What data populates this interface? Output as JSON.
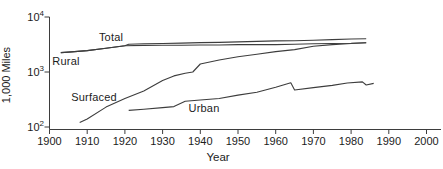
{
  "figure": {
    "background": "#ffffff",
    "line_color": "#3d3d3d",
    "text_color": "#1c1c1c"
  },
  "chart_data": {
    "type": "line",
    "title": "",
    "xlabel": "Year",
    "ylabel": "1,000 Miles",
    "grid": false,
    "legend_position": "inline-annotations",
    "x_axis": {
      "min": 1900,
      "max": 2000,
      "tick_interval": 10,
      "ticks": [
        1900,
        1910,
        1920,
        1930,
        1940,
        1950,
        1960,
        1970,
        1980,
        1990,
        2000
      ]
    },
    "y_axis": {
      "scale": "log",
      "min": 100,
      "max": 10000,
      "ticks": [
        {
          "value": 10000,
          "base": "10",
          "exp": "4"
        },
        {
          "value": 1000,
          "base": "10",
          "exp": "3"
        },
        {
          "value": 100,
          "base": "10",
          "exp": "2"
        }
      ]
    },
    "series": [
      {
        "name": "Total",
        "points": [
          [
            1903,
            2250
          ],
          [
            1905,
            2300
          ],
          [
            1910,
            2450
          ],
          [
            1915,
            2700
          ],
          [
            1920,
            3000
          ],
          [
            1921,
            3200
          ],
          [
            1925,
            3250
          ],
          [
            1930,
            3300
          ],
          [
            1935,
            3350
          ],
          [
            1940,
            3420
          ],
          [
            1945,
            3450
          ],
          [
            1950,
            3530
          ],
          [
            1955,
            3600
          ],
          [
            1960,
            3680
          ],
          [
            1965,
            3700
          ],
          [
            1970,
            3780
          ],
          [
            1975,
            3880
          ],
          [
            1980,
            3980
          ],
          [
            1984,
            4020
          ]
        ]
      },
      {
        "name": "Rural",
        "points": [
          [
            1903,
            2250
          ],
          [
            1905,
            2300
          ],
          [
            1910,
            2450
          ],
          [
            1915,
            2700
          ],
          [
            1920,
            3000
          ],
          [
            1925,
            3040
          ],
          [
            1930,
            3075
          ],
          [
            1935,
            3060
          ],
          [
            1940,
            3100
          ],
          [
            1945,
            3100
          ],
          [
            1950,
            3150
          ],
          [
            1955,
            3150
          ],
          [
            1960,
            3150
          ],
          [
            1965,
            3200
          ],
          [
            1970,
            3250
          ],
          [
            1975,
            3300
          ],
          [
            1980,
            3320
          ],
          [
            1984,
            3400
          ]
        ]
      },
      {
        "name": "Surfaced",
        "points": [
          [
            1908,
            120
          ],
          [
            1910,
            140
          ],
          [
            1915,
            230
          ],
          [
            1920,
            330
          ],
          [
            1925,
            450
          ],
          [
            1930,
            700
          ],
          [
            1933,
            850
          ],
          [
            1936,
            950
          ],
          [
            1938,
            1000
          ],
          [
            1940,
            1400
          ],
          [
            1945,
            1650
          ],
          [
            1950,
            1900
          ],
          [
            1955,
            2100
          ],
          [
            1960,
            2350
          ],
          [
            1965,
            2550
          ],
          [
            1970,
            2950
          ],
          [
            1975,
            3150
          ],
          [
            1980,
            3300
          ],
          [
            1984,
            3400
          ]
        ]
      },
      {
        "name": "Urban",
        "points": [
          [
            1921,
            200
          ],
          [
            1925,
            210
          ],
          [
            1930,
            225
          ],
          [
            1933,
            235
          ],
          [
            1936,
            295
          ],
          [
            1940,
            310
          ],
          [
            1945,
            330
          ],
          [
            1950,
            380
          ],
          [
            1955,
            430
          ],
          [
            1960,
            530
          ],
          [
            1964,
            640
          ],
          [
            1965,
            470
          ],
          [
            1970,
            520
          ],
          [
            1975,
            570
          ],
          [
            1979,
            630
          ],
          [
            1983,
            660
          ],
          [
            1984,
            580
          ],
          [
            1986,
            620
          ]
        ]
      }
    ],
    "annotations": [
      {
        "text": "Total",
        "x": 111,
        "y": 37
      },
      {
        "text": "Rural",
        "x": 66,
        "y": 61
      },
      {
        "text": "Surfaced",
        "x": 94,
        "y": 97
      },
      {
        "text": "Urban",
        "x": 204,
        "y": 108
      }
    ]
  }
}
